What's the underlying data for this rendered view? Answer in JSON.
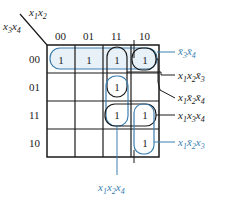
{
  "kmap": {
    "col_var_label": {
      "x1": "x",
      "s1": "1",
      "x2": "x",
      "s2": "2"
    },
    "row_var_label": {
      "x3": "x",
      "s3": "3",
      "x4": "x",
      "s4": "4"
    },
    "col_headers": [
      "00",
      "01",
      "11",
      "10"
    ],
    "row_headers": [
      "00",
      "01",
      "11",
      "10"
    ],
    "cells": [
      [
        "1",
        "1",
        "1",
        "1"
      ],
      [
        "",
        "",
        "1",
        ""
      ],
      [
        "",
        "",
        "1",
        "1"
      ],
      [
        "",
        "",
        "",
        "1"
      ]
    ],
    "one": "1"
  },
  "terms": [
    {
      "id": "t1",
      "text": "x̄3x̄4",
      "parts": [
        {
          "v": "x̄",
          "s": "3"
        },
        {
          "v": "x̄",
          "s": "4"
        }
      ],
      "color": "#3c7fb1"
    },
    {
      "id": "t2",
      "text": "x1x2x̄3",
      "parts": [
        {
          "v": "x",
          "s": "1"
        },
        {
          "v": "x",
          "s": "2"
        },
        {
          "v": "x̄",
          "s": "3"
        }
      ],
      "color": "#222222"
    },
    {
      "id": "t3",
      "text": "x1x̄2x̄4",
      "parts": [
        {
          "v": "x",
          "s": "1"
        },
        {
          "v": "x̄",
          "s": "2"
        },
        {
          "v": "x̄",
          "s": "4"
        }
      ],
      "color": "#222222"
    },
    {
      "id": "t4",
      "text": "x1x3x4",
      "parts": [
        {
          "v": "x",
          "s": "1"
        },
        {
          "v": "x",
          "s": "3"
        },
        {
          "v": "x",
          "s": "4"
        }
      ],
      "color": "#222222"
    },
    {
      "id": "t5",
      "text": "x1x̄2x3",
      "parts": [
        {
          "v": "x",
          "s": "1"
        },
        {
          "v": "x̄",
          "s": "2"
        },
        {
          "v": "x",
          "s": "3"
        }
      ],
      "color": "#3c7fb1"
    },
    {
      "id": "t6",
      "text": "x1x2x4",
      "parts": [
        {
          "v": "x",
          "s": "1"
        },
        {
          "v": "x",
          "s": "2"
        },
        {
          "v": "x",
          "s": "4"
        }
      ],
      "color": "#3c7fb1"
    }
  ],
  "colors": {
    "grid": "#1a1a1a",
    "highlight": "#3c7fb1",
    "loop_fill": "#e8f1f8"
  }
}
